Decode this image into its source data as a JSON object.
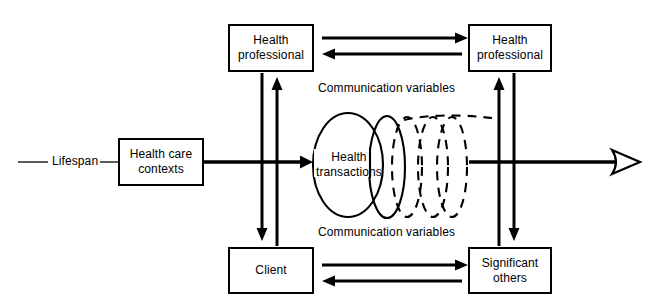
{
  "diagram": {
    "stroke_color": "#000000",
    "background_color": "#ffffff",
    "nodes": [
      {
        "id": "health-professional-left",
        "label": "Health\nprofessional"
      },
      {
        "id": "health-professional-right",
        "label": "Health\nprofessional"
      },
      {
        "id": "health-care-contexts",
        "label": "Health care\ncontexts"
      },
      {
        "id": "client",
        "label": "Client"
      },
      {
        "id": "significant-others",
        "label": "Significant\nothers"
      }
    ],
    "labels": {
      "lifespan": "Lifespan",
      "communication_variables_top": "Communication variables",
      "communication_variables_bottom": "Communication variables",
      "health_transactions": "Health\ntransactions"
    },
    "connectors": [
      {
        "id": "top-forward",
        "from": "health-professional-left",
        "to": "health-professional-right",
        "direction": "right"
      },
      {
        "id": "top-back",
        "from": "health-professional-right",
        "to": "health-professional-left",
        "direction": "left"
      },
      {
        "id": "bottom-forward",
        "from": "client",
        "to": "significant-others",
        "direction": "right"
      },
      {
        "id": "bottom-back",
        "from": "significant-others",
        "to": "client",
        "direction": "left"
      },
      {
        "id": "left-down",
        "from": "health-professional-left",
        "to": "client",
        "direction": "down"
      },
      {
        "id": "left-up",
        "from": "client",
        "to": "health-professional-left",
        "direction": "up"
      },
      {
        "id": "right-up",
        "from": "significant-others",
        "to": "health-professional-right",
        "direction": "up"
      },
      {
        "id": "right-down",
        "from": "health-professional-right",
        "to": "significant-others",
        "direction": "down"
      },
      {
        "id": "lifespan-axis",
        "from": "lifespan",
        "to": "future",
        "direction": "right"
      }
    ],
    "helix": {
      "description": "expanding helix of health transactions",
      "solid_loops": 2,
      "dashed_loops": 3
    }
  }
}
